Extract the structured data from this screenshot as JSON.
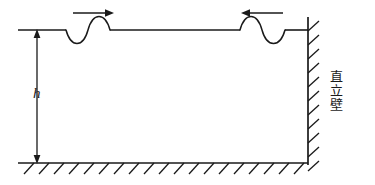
{
  "figure": {
    "type": "engineering-diagram",
    "colors": {
      "line": "#1a1a1a",
      "background": "#ffffff"
    },
    "labels": {
      "depth": "h",
      "wall_chars": [
        "直",
        "立",
        "壁"
      ],
      "wall_text": "直立壁"
    },
    "geometry": {
      "free_surface": {
        "x1": 18,
        "y1": 30,
        "x2": 308,
        "y2": 30
      },
      "seabed": {
        "x1": 18,
        "y1": 163,
        "x2": 308,
        "y2": 163
      },
      "vertical_wall": {
        "x": 308,
        "y_top": 17,
        "y_bottom": 165
      },
      "depth_dimension": {
        "x": 37,
        "y_top": 30,
        "y_bottom": 163
      }
    },
    "waves": [
      {
        "name": "incident-wave",
        "direction": "right",
        "arrow": {
          "x1": 73,
          "y1": 13,
          "x2": 114,
          "y2": 13
        },
        "span": {
          "x_start": 66,
          "x_end": 110
        },
        "phase": "trough-then-crest",
        "amplitude": 11
      },
      {
        "name": "reflected-wave",
        "direction": "left",
        "arrow": {
          "x1": 283,
          "y1": 13,
          "x2": 241,
          "y2": 13
        },
        "span": {
          "x_start": 240,
          "x_end": 285
        },
        "phase": "crest-then-trough",
        "amplitude": 11
      }
    ],
    "hatching": {
      "seabed": {
        "count": 19,
        "x_start": 24,
        "x_end": 306,
        "length": 13,
        "angle_deg": 45
      },
      "wall": {
        "count": 11,
        "y_start": 21,
        "y_end": 161,
        "length": 13,
        "angle_deg": 45
      }
    }
  }
}
